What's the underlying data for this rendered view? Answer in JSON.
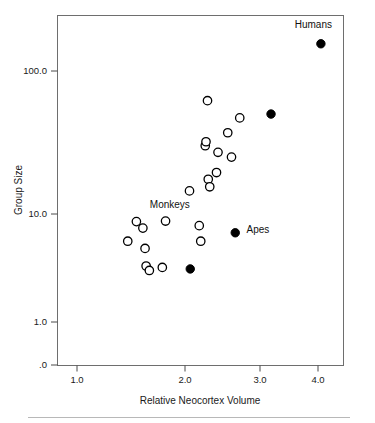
{
  "chart_data": {
    "type": "scatter",
    "title": "",
    "xlabel": "Relative Neocortex Volume",
    "ylabel": "Group Size",
    "xlim": [
      0.78,
      4.55
    ],
    "ylim_log": [
      0.3,
      300
    ],
    "yscale": "log",
    "xticks": [
      1.0,
      2.0,
      3.0,
      4.0
    ],
    "xtick_labels": [
      "1.0",
      "2.0",
      "3.0",
      "4.0"
    ],
    "yticks": [
      100.0,
      10.0,
      1.0,
      0.1
    ],
    "ytick_labels": [
      "100.0",
      "10.0",
      "1.0",
      ".0"
    ],
    "grid": false,
    "legend": "none",
    "annotations": [
      {
        "text": "Humans",
        "x": 3.92,
        "y": 200.0
      },
      {
        "text": "Monkeys",
        "x": 1.86,
        "y": 11.0
      },
      {
        "text": "Apes",
        "x": 2.82,
        "y": 6.7
      }
    ],
    "series": [
      {
        "name": "Monkeys",
        "marker": "open-circle",
        "color": "#000000",
        "points": [
          {
            "x": 1.47,
            "y": 5.6
          },
          {
            "x": 1.55,
            "y": 8.5
          },
          {
            "x": 1.61,
            "y": 7.4
          },
          {
            "x": 1.63,
            "y": 4.8
          },
          {
            "x": 1.64,
            "y": 3.3
          },
          {
            "x": 1.67,
            "y": 3.0
          },
          {
            "x": 1.79,
            "y": 3.2
          },
          {
            "x": 1.82,
            "y": 8.6
          },
          {
            "x": 2.06,
            "y": 14.5
          },
          {
            "x": 2.19,
            "y": 7.8
          },
          {
            "x": 2.21,
            "y": 5.6
          },
          {
            "x": 2.27,
            "y": 30.0
          },
          {
            "x": 2.28,
            "y": 32.0
          },
          {
            "x": 2.3,
            "y": 62.0
          },
          {
            "x": 2.31,
            "y": 17.5
          },
          {
            "x": 2.33,
            "y": 15.5
          },
          {
            "x": 2.42,
            "y": 19.5
          },
          {
            "x": 2.44,
            "y": 27.0
          },
          {
            "x": 2.57,
            "y": 37.0
          },
          {
            "x": 2.62,
            "y": 25.0
          },
          {
            "x": 2.73,
            "y": 47.0
          }
        ]
      },
      {
        "name": "Apes and Humans",
        "marker": "filled-circle",
        "color": "#000000",
        "points": [
          {
            "x": 2.07,
            "y": 3.1
          },
          {
            "x": 2.67,
            "y": 6.7
          },
          {
            "x": 3.19,
            "y": 50.0
          },
          {
            "x": 4.05,
            "y": 155.0
          }
        ]
      }
    ]
  },
  "figure": {
    "footer_rule": true
  }
}
